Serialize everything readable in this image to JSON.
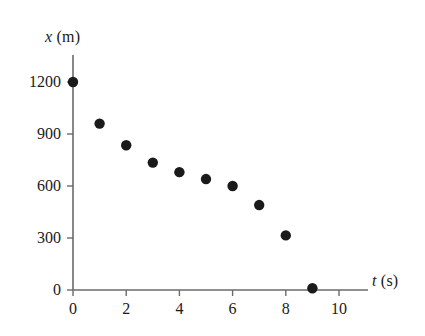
{
  "chart_data": {
    "type": "scatter",
    "title": "",
    "xlabel": "t (s)",
    "ylabel": "x (m)",
    "xlabel_var": "t",
    "xlabel_unit": "(s)",
    "ylabel_var": "x",
    "ylabel_unit": "(m)",
    "x": [
      0,
      1,
      2,
      3,
      4,
      5,
      6,
      7,
      8,
      9
    ],
    "values": [
      1200,
      960,
      835,
      735,
      680,
      640,
      600,
      490,
      315,
      10
    ],
    "series": [
      {
        "name": "position",
        "x": [
          0,
          1,
          2,
          3,
          4,
          5,
          6,
          7,
          8,
          9
        ],
        "values": [
          1200,
          960,
          835,
          735,
          680,
          640,
          600,
          490,
          315,
          10
        ]
      }
    ],
    "xlim": [
      0,
      11
    ],
    "ylim": [
      0,
      1290
    ],
    "xticks": [
      0,
      2,
      4,
      6,
      8,
      10
    ],
    "xtick_labels": [
      "0",
      "2",
      "4",
      "6",
      "8",
      "10"
    ],
    "yticks": [
      0,
      300,
      600,
      900,
      1200
    ],
    "ytick_labels": [
      "0",
      "300",
      "600",
      "900",
      "1200"
    ],
    "grid": false,
    "legend": false,
    "marker": "filled-circle",
    "marker_color": "#1a1a1a",
    "marker_size": 5.2,
    "axis_color": "#6b6b6b",
    "background": "#ffffff"
  },
  "geometry": {
    "origin_x": 73,
    "origin_y": 290,
    "x_pixels_per_unit": 26.6,
    "y_pixels_per_300": 52,
    "y_axis_top": 55,
    "x_axis_right": 368
  }
}
